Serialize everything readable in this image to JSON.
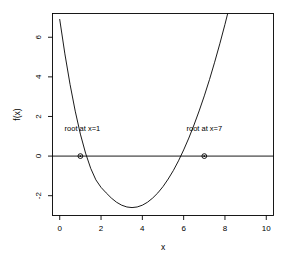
{
  "chart_data": {
    "type": "line",
    "title": "",
    "xlabel": "x",
    "ylabel": "f(x)",
    "xlim": [
      -0.35,
      10.35
    ],
    "ylim": [
      -3.0,
      7.2
    ],
    "xticks": [
      0,
      2,
      4,
      6,
      8,
      10
    ],
    "xtick_labels": [
      "0",
      "2",
      "4",
      "6",
      "8",
      "10"
    ],
    "yticks": [
      -2,
      0,
      2,
      4,
      6
    ],
    "ytick_labels": [
      "-2",
      "0",
      "2",
      "4",
      "6"
    ],
    "grid": false,
    "legend": null,
    "hlines": [
      {
        "y": 0,
        "color": "#000000"
      }
    ],
    "series": [
      {
        "name": "f(x)",
        "color": "#000000",
        "x": [
          0.0,
          0.25,
          0.5,
          0.75,
          1.0,
          1.25,
          1.5,
          1.75,
          2.0,
          2.25,
          2.5,
          2.75,
          3.0,
          3.25,
          3.5,
          3.75,
          4.0,
          4.25,
          4.5,
          4.75,
          5.0,
          5.25,
          5.5,
          5.75,
          6.0,
          6.25,
          6.5,
          6.75,
          7.0,
          7.25,
          7.5,
          7.75,
          8.0,
          8.25,
          8.5,
          8.75,
          9.0,
          9.25,
          9.5,
          9.75,
          10.0
        ],
        "y": [
          6.9,
          5.16,
          3.62,
          2.27,
          1.11,
          0.15,
          -0.62,
          -1.2,
          -1.58,
          -1.86,
          -2.12,
          -2.33,
          -2.48,
          -2.57,
          -2.6,
          -2.57,
          -2.48,
          -2.33,
          -2.12,
          -1.86,
          -1.54,
          -1.16,
          -0.73,
          -0.24,
          0.31,
          0.91,
          1.57,
          2.28,
          3.04,
          3.86,
          4.74,
          5.67,
          6.65,
          7.69,
          8.78,
          9.92,
          11.12,
          12.37,
          13.67,
          15.03,
          16.44
        ]
      }
    ],
    "points": [
      {
        "name": "root-1",
        "x": 1.0,
        "y": 0.0,
        "marker": "circle"
      },
      {
        "name": "root-7",
        "x": 7.0,
        "y": 0.0,
        "marker": "circle"
      }
    ],
    "annotations": [
      {
        "name": "root-1-label",
        "text": "root at x=1",
        "x": 1.1,
        "y": 1.25
      },
      {
        "name": "root-7-label",
        "text": "root at x=7",
        "x": 7.0,
        "y": 1.25
      }
    ],
    "colors": {
      "line": "#000000",
      "axis": "#000000",
      "text": "#000000",
      "background": "#ffffff"
    }
  }
}
